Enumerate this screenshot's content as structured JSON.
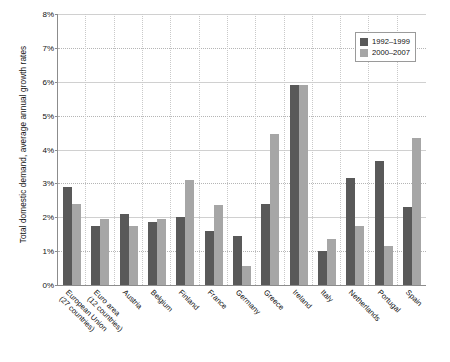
{
  "chart_data": {
    "type": "bar",
    "title": "",
    "xlabel": "",
    "ylabel": "Total domestic demand, average annual growth rates",
    "ylim": [
      0,
      8
    ],
    "ytick_labels": [
      "8%",
      "7%",
      "6%",
      "5%",
      "4%",
      "3%",
      "2%",
      "1%",
      "0%"
    ],
    "ytick_values": [
      8,
      7,
      6,
      5,
      4,
      3,
      2,
      1,
      0
    ],
    "grid": true,
    "legend_position": "top-right",
    "categories": [
      "European Union (27 countries)",
      "Euro area (12 countries)",
      "Austria",
      "Belgium",
      "Finland",
      "France",
      "Germany",
      "Greece",
      "Ireland",
      "Italy",
      "Netherlands",
      "Portugal",
      "Spain"
    ],
    "category_lines": [
      [
        "European Union",
        "(27 countries)"
      ],
      [
        "Euro area",
        "(12 countries)"
      ],
      [
        "Austria",
        ""
      ],
      [
        "Belgium",
        ""
      ],
      [
        "Finland",
        ""
      ],
      [
        "France",
        ""
      ],
      [
        "Germany",
        ""
      ],
      [
        "Greece",
        ""
      ],
      [
        "Ireland",
        ""
      ],
      [
        "Italy",
        ""
      ],
      [
        "Netherlands",
        ""
      ],
      [
        "Portugal",
        ""
      ],
      [
        "Spain",
        ""
      ]
    ],
    "series": [
      {
        "name": "1992–1999",
        "color": "#595959",
        "values": [
          2.9,
          1.75,
          2.1,
          1.85,
          2.0,
          1.6,
          1.45,
          2.4,
          5.9,
          1.0,
          3.15,
          3.65,
          2.3
        ]
      },
      {
        "name": "2000–2007",
        "color": "#a6a6a6",
        "values": [
          2.4,
          1.95,
          1.75,
          1.95,
          3.1,
          2.35,
          0.55,
          4.45,
          5.9,
          1.35,
          1.75,
          1.15,
          4.35
        ]
      }
    ]
  },
  "legend": {
    "items": [
      {
        "label": "1992–1999",
        "color": "#595959"
      },
      {
        "label": "2000–2007",
        "color": "#a6a6a6"
      }
    ]
  },
  "axes": {
    "y_title": "Total domestic demand, average annual growth rates"
  }
}
